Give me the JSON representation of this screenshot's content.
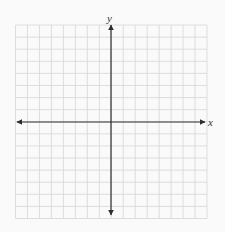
{
  "diagram": {
    "type": "cartesian-coordinate-grid",
    "x_axis_label": "x",
    "y_axis_label": "y",
    "grid_columns": 16,
    "grid_rows": 16,
    "x_range": [
      -8,
      8
    ],
    "y_range": [
      -8,
      8
    ],
    "arrows": {
      "x_both_ends": true,
      "y_both_ends": true
    },
    "colors": {
      "background": "#fafafa",
      "grid_line": "#d6d6d6",
      "axis": "#2e2e2e"
    }
  }
}
